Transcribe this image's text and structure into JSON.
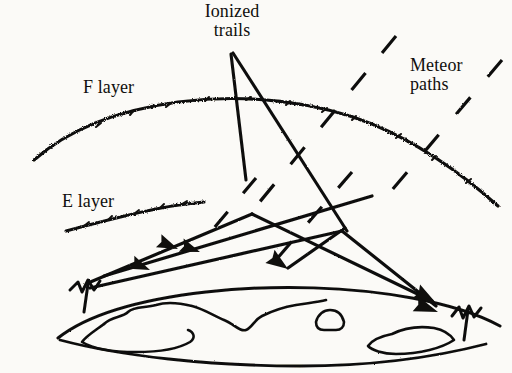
{
  "figure": {
    "background_color": "#fbfaf7",
    "ink_color": "#100f0d",
    "width": 512,
    "height": 373
  },
  "labels": {
    "ionized_trails": "Ionized\ntrails",
    "meteor_paths": "Meteor\npaths",
    "f_layer": "F layer",
    "e_layer": "E layer"
  },
  "icons": {
    "antenna_left": "antenna-icon",
    "antenna_right": "antenna-icon",
    "arrowhead": "arrowhead-icon"
  },
  "diagram_elements": {
    "ionospheric_layers": [
      {
        "name": "F layer",
        "style": "jagged-arc",
        "description": "upper ionospheric layer drawn as a rough arc across the top"
      },
      {
        "name": "E layer",
        "style": "jagged-segment",
        "description": "lower ionospheric layer drawn as a short rough line at left"
      }
    ],
    "meteor_paths": {
      "style": "dashed",
      "count": 9,
      "direction": "descending from upper right to lower left"
    },
    "signal_paths": {
      "style": "solid-with-arrowheads",
      "arrowhead_count": 5,
      "description": "radio signal rays between two ground antennas reflecting off ionized meteor trails"
    },
    "ground": {
      "name": "earth-surface",
      "description": "curved earth horizon with continent outlines"
    },
    "antennas": [
      {
        "position": "left",
        "label": ""
      },
      {
        "position": "right",
        "label": ""
      }
    ],
    "leader_lines": [
      {
        "from": "Ionized trails",
        "to": "trail-point-left"
      },
      {
        "from": "Ionized trails",
        "to": "trail-point-right"
      }
    ]
  }
}
